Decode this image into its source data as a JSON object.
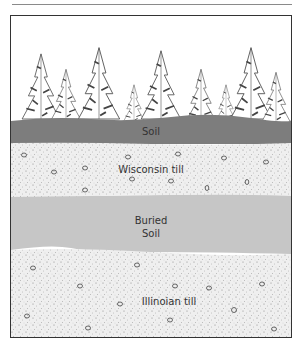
{
  "figure": {
    "type": "soil stratigraphy cross-section",
    "layers": [
      {
        "id": "forest",
        "label": "",
        "fill": "#ffffff"
      },
      {
        "id": "soil",
        "label": "Soil",
        "fill": "#7d7d7d"
      },
      {
        "id": "wisconsin_till",
        "label": "Wisconsin till",
        "fill": "#ececec"
      },
      {
        "id": "buried_soil",
        "label_line1": "Buried",
        "label_line2": "Soil",
        "fill": "#c6c6c6"
      },
      {
        "id": "illinoian_till",
        "label": "Illinoian till",
        "fill": "#ececec"
      }
    ]
  },
  "labels": {
    "soil": "Soil",
    "wisconsin_till": "Wisconsin till",
    "buried_soil_1": "Buried",
    "buried_soil_2": "Soil",
    "illinoian_till": "Illinoian till"
  }
}
